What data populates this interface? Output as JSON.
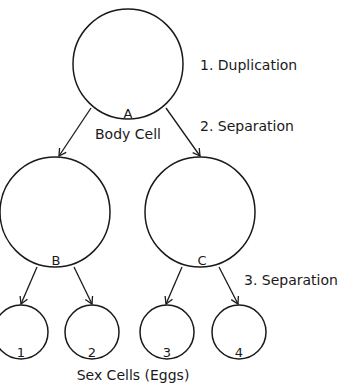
{
  "diagram": {
    "steps": [
      {
        "id": "step1",
        "label": "1. Duplication"
      },
      {
        "id": "step2",
        "label": "2. Separation"
      },
      {
        "id": "step3",
        "label": "3. Separation"
      }
    ],
    "cells": {
      "A": {
        "letter": "A",
        "caption": "Body Cell"
      },
      "B": {
        "letter": "B"
      },
      "C": {
        "letter": "C"
      }
    },
    "sex_cells": {
      "caption": "Sex Cells (Eggs)",
      "items": [
        {
          "label": "1"
        },
        {
          "label": "2"
        },
        {
          "label": "3"
        },
        {
          "label": "4"
        }
      ]
    },
    "stroke_color": "#1a1a1a",
    "background": "#ffffff"
  }
}
